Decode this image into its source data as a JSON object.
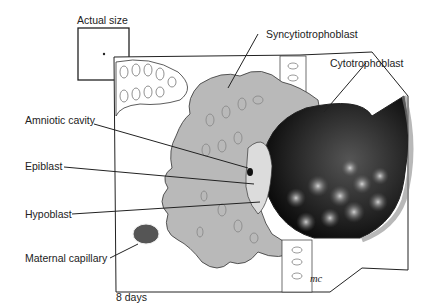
{
  "scale_box": {
    "label": "Actual size"
  },
  "labels": {
    "syncytiotrophoblast": "Syncytiotrophoblast",
    "cytotrophoblast": "Cytotrophoblast",
    "amniotic_cavity": "Amniotic cavity",
    "epiblast": "Epiblast",
    "hypoblast": "Hypoblast",
    "maternal_capillary": "Maternal capillary"
  },
  "caption": "8 days",
  "signature": "mc"
}
